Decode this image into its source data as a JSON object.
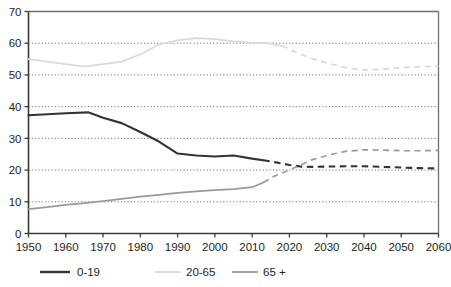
{
  "figure": {
    "clipped_title_fragment": "",
    "background_color": "#ffffff",
    "plot_border_color": "#6e6e6e",
    "gridline_color": "#595959"
  },
  "axes": {
    "y_ticks": [
      "0",
      "10",
      "20",
      "30",
      "40",
      "50",
      "60",
      "70"
    ],
    "x_ticks": [
      "1950",
      "1960",
      "1970",
      "1980",
      "1990",
      "2000",
      "2010",
      "2020",
      "2030",
      "2040",
      "2050",
      "2060"
    ]
  },
  "legend": {
    "items": [
      {
        "label": "0-19",
        "color": "#333333"
      },
      {
        "label": "20-65",
        "color": "#d9d9d9"
      },
      {
        "label": "65 +",
        "color": "#999999"
      }
    ]
  },
  "chart_data": {
    "type": "line",
    "title": "",
    "subtitle": "",
    "xlabel": "",
    "ylabel": "",
    "xlim": [
      1950,
      2060
    ],
    "ylim": [
      0,
      70
    ],
    "y_ticks": [
      0,
      10,
      20,
      30,
      40,
      50,
      60,
      70
    ],
    "x_ticks": [
      1950,
      1960,
      1970,
      1980,
      1990,
      2000,
      2010,
      2020,
      2030,
      2040,
      2050,
      2060
    ],
    "grid": "horizontal-dotted",
    "legend_position": "below",
    "units": "percent of population",
    "projection_note": "solid = historical, dashed = projection",
    "series": [
      {
        "name": "0-19",
        "color": "#333333",
        "historical_end_year": 2013,
        "x": [
          1950,
          1955,
          1960,
          1966,
          1970,
          1975,
          1980,
          1985,
          1990,
          1995,
          2000,
          2005,
          2010,
          2013,
          2016,
          2020,
          2023,
          2026,
          2030,
          2035,
          2040,
          2045,
          2050,
          2055,
          2060
        ],
        "values": [
          37.3,
          37.6,
          37.9,
          38.2,
          36.5,
          34.8,
          32.0,
          29.0,
          25.2,
          24.6,
          24.3,
          24.6,
          23.6,
          23.1,
          22.5,
          21.6,
          21.1,
          21.0,
          21.1,
          21.2,
          21.2,
          21.0,
          20.8,
          20.6,
          20.5
        ]
      },
      {
        "name": "20-65",
        "color": "#d9d9d9",
        "historical_end_year": 2018,
        "x": [
          1950,
          1955,
          1960,
          1965,
          1970,
          1975,
          1980,
          1985,
          1990,
          1995,
          2000,
          2005,
          2010,
          2014,
          2018,
          2022,
          2026,
          2030,
          2035,
          2040,
          2045,
          2050,
          2055,
          2060
        ],
        "values": [
          55.0,
          54.2,
          53.4,
          52.6,
          53.4,
          54.2,
          56.5,
          59.6,
          60.9,
          61.6,
          61.3,
          60.6,
          60.2,
          60.0,
          59.2,
          57.0,
          55.2,
          53.8,
          52.3,
          51.5,
          51.8,
          52.3,
          52.6,
          52.8
        ]
      },
      {
        "name": "65 +",
        "color": "#999999",
        "historical_end_year": 2013,
        "x": [
          1950,
          1955,
          1960,
          1965,
          1970,
          1975,
          1980,
          1985,
          1990,
          1995,
          2000,
          2005,
          2010,
          2013,
          2016,
          2020,
          2023,
          2026,
          2030,
          2035,
          2040,
          2045,
          2050,
          2055,
          2060
        ],
        "values": [
          7.7,
          8.3,
          9.0,
          9.6,
          10.2,
          10.9,
          11.6,
          12.2,
          12.8,
          13.3,
          13.7,
          14.0,
          14.6,
          16.1,
          18.1,
          20.0,
          21.6,
          23.2,
          24.6,
          25.9,
          26.4,
          26.3,
          26.1,
          26.1,
          26.2
        ]
      }
    ]
  }
}
